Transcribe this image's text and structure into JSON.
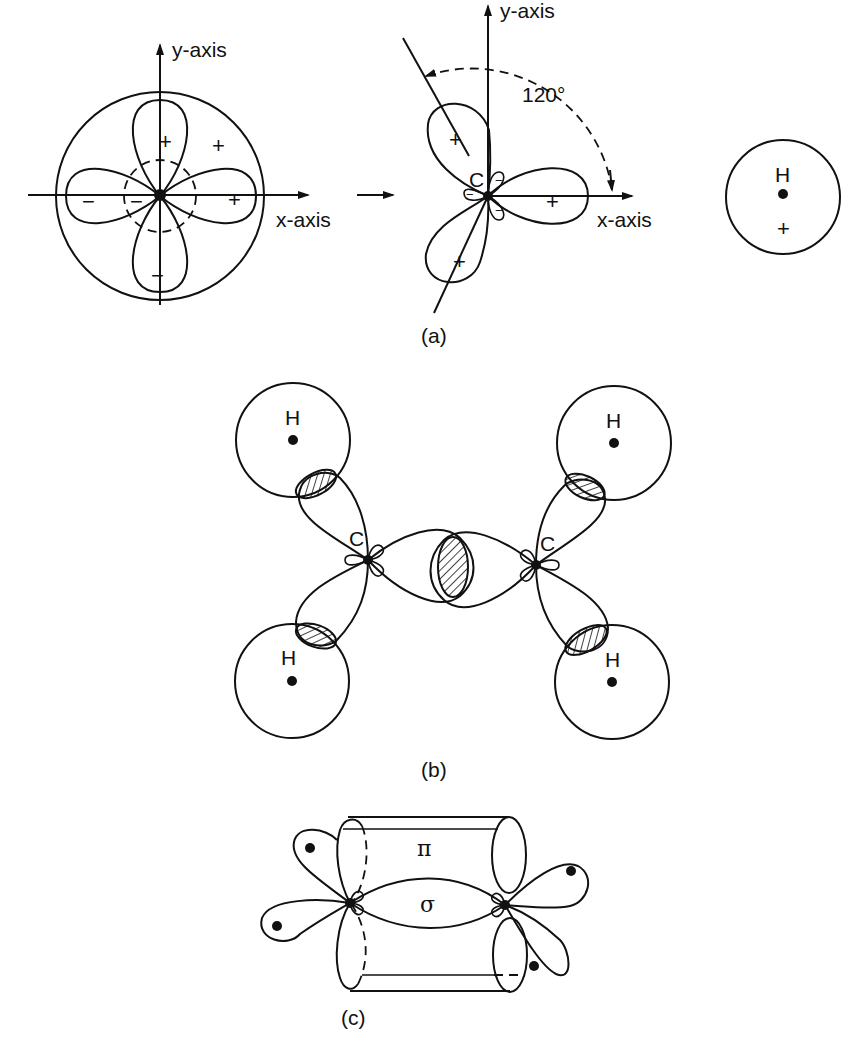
{
  "figure": {
    "panel_a": {
      "caption": "(a)",
      "left": {
        "y_axis_label": "y-axis",
        "x_axis_label": "x-axis",
        "signs": {
          "top_lobe": "+",
          "upper_right": "+",
          "right_lobe": "+",
          "left_lobe": "−",
          "inner_left": "−",
          "bottom_lobe": "−"
        }
      },
      "transition_arrow": "→",
      "middle": {
        "y_axis_label": "y-axis",
        "x_axis_label": "x-axis",
        "atom_label": "C",
        "angle_label": "120°",
        "signs": {
          "upper_lobe": "+",
          "right_lobe": "+",
          "lower_lobe": "+",
          "small_lobes": "−"
        }
      },
      "right": {
        "atom_label": "H",
        "sign": "+"
      }
    },
    "panel_b": {
      "caption": "(b)",
      "carbon_labels": [
        "C",
        "C"
      ],
      "hydrogen_labels": [
        "H",
        "H",
        "H",
        "H"
      ]
    },
    "panel_c": {
      "caption": "(c)",
      "pi_label": "π",
      "sigma_label": "σ"
    }
  }
}
